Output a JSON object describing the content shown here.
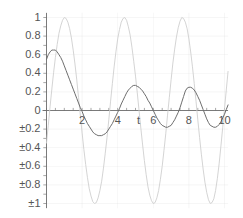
{
  "chart_data": {
    "type": "line",
    "title": "",
    "xlabel": "t",
    "ylabel": "",
    "xlim": [
      0,
      10.2
    ],
    "ylim": [
      -1.05,
      1.05
    ],
    "grid": true,
    "legend": null,
    "xticks": [
      {
        "value": 2,
        "label": "2"
      },
      {
        "value": 4,
        "label": "4"
      },
      {
        "value": 6,
        "label": "6"
      },
      {
        "value": 8,
        "label": "8"
      },
      {
        "value": 10,
        "label": "10"
      }
    ],
    "yticks": [
      {
        "value": 1,
        "label": "1"
      },
      {
        "value": 0.8,
        "label": "0.8"
      },
      {
        "value": 0.6,
        "label": "0.6"
      },
      {
        "value": 0.4,
        "label": "0.4"
      },
      {
        "value": 0.2,
        "label": "0.2"
      },
      {
        "value": 0,
        "label": "0"
      },
      {
        "value": -0.2,
        "label": "±0.2"
      },
      {
        "value": -0.4,
        "label": "±0.4"
      },
      {
        "value": -0.6,
        "label": "±0.6"
      },
      {
        "value": -0.8,
        "label": "±0.8"
      },
      {
        "value": -1,
        "label": "±1"
      }
    ],
    "series": [
      {
        "name": "undamped-sine",
        "color": "#cfcfcf",
        "width": 0.9,
        "description": "Light gray sinusoid, amplitude 1, period approx 3.15",
        "points": [
          [
            0.0,
            -0.35
          ],
          [
            0.1,
            -0.16
          ],
          [
            0.2,
            0.04
          ],
          [
            0.3,
            0.23
          ],
          [
            0.4,
            0.41
          ],
          [
            0.5,
            0.57
          ],
          [
            0.6,
            0.71
          ],
          [
            0.7,
            0.83
          ],
          [
            0.8,
            0.91
          ],
          [
            0.9,
            0.97
          ],
          [
            1.0,
            1.0
          ],
          [
            1.1,
            0.99
          ],
          [
            1.2,
            0.95
          ],
          [
            1.3,
            0.88
          ],
          [
            1.4,
            0.78
          ],
          [
            1.5,
            0.65
          ],
          [
            1.6,
            0.5
          ],
          [
            1.7,
            0.33
          ],
          [
            1.8,
            0.14
          ],
          [
            1.9,
            -0.05
          ],
          [
            2.0,
            -0.24
          ],
          [
            2.1,
            -0.42
          ],
          [
            2.2,
            -0.58
          ],
          [
            2.3,
            -0.72
          ],
          [
            2.4,
            -0.84
          ],
          [
            2.5,
            -0.92
          ],
          [
            2.6,
            -0.98
          ],
          [
            2.7,
            -1.0
          ],
          [
            2.8,
            -0.99
          ],
          [
            2.9,
            -0.94
          ],
          [
            3.0,
            -0.86
          ],
          [
            3.1,
            -0.76
          ],
          [
            3.2,
            -0.62
          ],
          [
            3.3,
            -0.46
          ],
          [
            3.4,
            -0.29
          ],
          [
            3.5,
            -0.1
          ],
          [
            3.6,
            0.1
          ],
          [
            3.7,
            0.29
          ],
          [
            3.8,
            0.47
          ],
          [
            3.9,
            0.63
          ],
          [
            4.0,
            0.77
          ],
          [
            4.1,
            0.87
          ],
          [
            4.2,
            0.95
          ],
          [
            4.3,
            0.99
          ],
          [
            4.4,
            1.0
          ],
          [
            4.5,
            0.97
          ],
          [
            4.6,
            0.9
          ],
          [
            4.7,
            0.81
          ],
          [
            4.8,
            0.68
          ],
          [
            4.9,
            0.53
          ],
          [
            5.0,
            0.37
          ],
          [
            5.1,
            0.19
          ],
          [
            5.2,
            0.0
          ],
          [
            5.3,
            -0.19
          ],
          [
            5.4,
            -0.37
          ],
          [
            5.5,
            -0.54
          ],
          [
            5.6,
            -0.69
          ],
          [
            5.7,
            -0.82
          ],
          [
            5.8,
            -0.91
          ],
          [
            5.9,
            -0.97
          ],
          [
            6.0,
            -1.0
          ],
          [
            6.1,
            -0.99
          ],
          [
            6.2,
            -0.94
          ],
          [
            6.3,
            -0.86
          ],
          [
            6.4,
            -0.74
          ],
          [
            6.5,
            -0.6
          ],
          [
            6.6,
            -0.43
          ],
          [
            6.7,
            -0.25
          ],
          [
            6.8,
            -0.05
          ],
          [
            6.9,
            0.14
          ],
          [
            7.0,
            0.33
          ],
          [
            7.1,
            0.51
          ],
          [
            7.2,
            0.66
          ],
          [
            7.3,
            0.79
          ],
          [
            7.4,
            0.89
          ],
          [
            7.5,
            0.96
          ],
          [
            7.6,
            1.0
          ],
          [
            7.7,
            0.99
          ],
          [
            7.8,
            0.95
          ],
          [
            7.9,
            0.88
          ],
          [
            8.0,
            0.77
          ],
          [
            8.1,
            0.63
          ],
          [
            8.2,
            0.47
          ],
          [
            8.3,
            0.29
          ],
          [
            8.4,
            0.1
          ],
          [
            8.5,
            -0.1
          ],
          [
            8.6,
            -0.29
          ],
          [
            8.7,
            -0.47
          ],
          [
            8.8,
            -0.63
          ],
          [
            8.9,
            -0.77
          ],
          [
            9.0,
            -0.88
          ],
          [
            9.1,
            -0.96
          ],
          [
            9.2,
            -1.0
          ],
          [
            9.3,
            -0.99
          ],
          [
            9.4,
            -0.95
          ],
          [
            9.5,
            -0.86
          ],
          [
            9.6,
            -0.73
          ],
          [
            9.7,
            -0.57
          ],
          [
            9.8,
            -0.38
          ],
          [
            9.9,
            -0.18
          ],
          [
            10.0,
            0.02
          ],
          [
            10.1,
            0.22
          ],
          [
            10.2,
            0.42
          ]
        ]
      },
      {
        "name": "damped-oscillation",
        "color": "#6d6d6d",
        "width": 1.0,
        "description": "Darker decaying oscillation starting near 0.55, first peak 0.65",
        "points": [
          [
            0.0,
            0.55
          ],
          [
            0.1,
            0.6
          ],
          [
            0.2,
            0.63
          ],
          [
            0.3,
            0.65
          ],
          [
            0.4,
            0.65
          ],
          [
            0.5,
            0.65
          ],
          [
            0.6,
            0.63
          ],
          [
            0.7,
            0.6
          ],
          [
            0.8,
            0.57
          ],
          [
            0.9,
            0.53
          ],
          [
            1.0,
            0.48
          ],
          [
            1.1,
            0.43
          ],
          [
            1.2,
            0.38
          ],
          [
            1.3,
            0.33
          ],
          [
            1.4,
            0.28
          ],
          [
            1.5,
            0.23
          ],
          [
            1.6,
            0.18
          ],
          [
            1.7,
            0.13
          ],
          [
            1.8,
            0.08
          ],
          [
            1.9,
            0.03
          ],
          [
            2.0,
            -0.01
          ],
          [
            2.1,
            -0.06
          ],
          [
            2.2,
            -0.1
          ],
          [
            2.3,
            -0.14
          ],
          [
            2.4,
            -0.17
          ],
          [
            2.5,
            -0.2
          ],
          [
            2.6,
            -0.23
          ],
          [
            2.7,
            -0.25
          ],
          [
            2.8,
            -0.26
          ],
          [
            2.9,
            -0.27
          ],
          [
            3.0,
            -0.27
          ],
          [
            3.1,
            -0.27
          ],
          [
            3.2,
            -0.26
          ],
          [
            3.3,
            -0.25
          ],
          [
            3.4,
            -0.23
          ],
          [
            3.5,
            -0.2
          ],
          [
            3.6,
            -0.17
          ],
          [
            3.7,
            -0.14
          ],
          [
            3.8,
            -0.1
          ],
          [
            3.9,
            -0.06
          ],
          [
            4.0,
            -0.02
          ],
          [
            4.1,
            0.02
          ],
          [
            4.2,
            0.07
          ],
          [
            4.3,
            0.11
          ],
          [
            4.4,
            0.15
          ],
          [
            4.5,
            0.19
          ],
          [
            4.6,
            0.22
          ],
          [
            4.7,
            0.24
          ],
          [
            4.8,
            0.26
          ],
          [
            4.9,
            0.27
          ],
          [
            5.0,
            0.27
          ],
          [
            5.1,
            0.26
          ],
          [
            5.2,
            0.25
          ],
          [
            5.3,
            0.23
          ],
          [
            5.4,
            0.21
          ],
          [
            5.5,
            0.18
          ],
          [
            5.6,
            0.15
          ],
          [
            5.7,
            0.11
          ],
          [
            5.8,
            0.08
          ],
          [
            5.9,
            0.04
          ],
          [
            6.0,
            0.0
          ],
          [
            6.1,
            -0.04
          ],
          [
            6.2,
            -0.08
          ],
          [
            6.3,
            -0.11
          ],
          [
            6.4,
            -0.14
          ],
          [
            6.5,
            -0.16
          ],
          [
            6.6,
            -0.17
          ],
          [
            6.7,
            -0.18
          ],
          [
            6.8,
            -0.18
          ],
          [
            6.9,
            -0.17
          ],
          [
            7.0,
            -0.16
          ],
          [
            7.1,
            -0.13
          ],
          [
            7.2,
            -0.1
          ],
          [
            7.3,
            -0.06
          ],
          [
            7.4,
            -0.02
          ],
          [
            7.5,
            0.03
          ],
          [
            7.6,
            0.09
          ],
          [
            7.7,
            0.15
          ],
          [
            7.8,
            0.21
          ],
          [
            7.9,
            0.24
          ],
          [
            8.0,
            0.25
          ],
          [
            8.1,
            0.25
          ],
          [
            8.2,
            0.24
          ],
          [
            8.3,
            0.22
          ],
          [
            8.4,
            0.19
          ],
          [
            8.5,
            0.15
          ],
          [
            8.6,
            0.11
          ],
          [
            8.7,
            0.06
          ],
          [
            8.8,
            0.01
          ],
          [
            8.9,
            -0.04
          ],
          [
            9.0,
            -0.09
          ],
          [
            9.1,
            -0.13
          ],
          [
            9.2,
            -0.16
          ],
          [
            9.3,
            -0.17
          ],
          [
            9.4,
            -0.18
          ],
          [
            9.5,
            -0.18
          ],
          [
            9.6,
            -0.17
          ],
          [
            9.7,
            -0.15
          ],
          [
            9.8,
            -0.12
          ],
          [
            9.9,
            -0.08
          ],
          [
            10.0,
            -0.04
          ],
          [
            10.1,
            0.01
          ],
          [
            10.2,
            0.06
          ]
        ]
      }
    ],
    "colors": {
      "axis": "#6b6b6b",
      "grid": "#d6d6d6",
      "text": "#555555",
      "background": "#ffffff"
    }
  }
}
